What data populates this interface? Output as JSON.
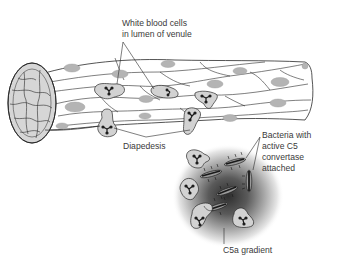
{
  "figure": {
    "type": "biology-illustration"
  },
  "labels": {
    "wbc": {
      "lines": [
        "White blood cells",
        "in lumen of venule"
      ]
    },
    "diapedesis": {
      "text": "Diapedesis"
    },
    "bacteria": {
      "lines": [
        "Bacteria with",
        "active C5",
        "convertase",
        "attached"
      ]
    },
    "gradient": {
      "text": "C5a gradient"
    }
  },
  "colors": {
    "outline": "#2a2a2a",
    "nucleus_fill": "#b4b4b4",
    "cell_fill": "#d2d2d2",
    "vessel_fill": "#ffffff",
    "gradient_center": "#3c3c3c",
    "label_text": "#3a3a3a"
  }
}
